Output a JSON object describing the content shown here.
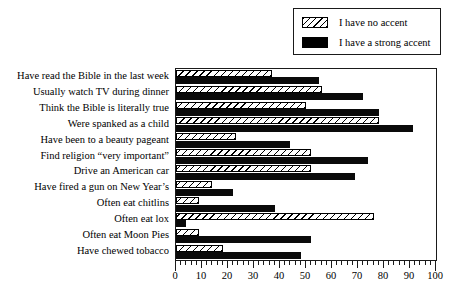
{
  "chart_data": {
    "type": "bar",
    "orientation": "horizontal",
    "title": "",
    "subtitle": "",
    "xlabel": "",
    "ylabel": "",
    "xlim": [
      0,
      100
    ],
    "xticks": [
      0,
      10,
      20,
      30,
      40,
      50,
      60,
      70,
      80,
      90,
      100
    ],
    "xtick_labels": [
      "0",
      "10",
      "20",
      "30",
      "40",
      "50",
      "60",
      "70",
      "80",
      "90",
      "100"
    ],
    "minor_tick_step": 2,
    "grid": false,
    "legend_position": "top-right",
    "categories": [
      "Have read the Bible in the last week",
      "Usually watch TV during dinner",
      "Think the Bible is literally true",
      "Were spanked as a child",
      "Have been to a beauty pageant",
      "Find religion “very important”",
      "Drive an American car",
      "Have fired a gun on New Year’s",
      "Often eat chitlins",
      "Often eat lox",
      "Often eat Moon Pies",
      "Have chewed tobacco"
    ],
    "series": [
      {
        "name": "I have no accent",
        "fill": "hatched",
        "color": "#ffffff",
        "edge_color": "#000000",
        "values": [
          37,
          56,
          50,
          78,
          23,
          52,
          52,
          14,
          9,
          76,
          9,
          18
        ]
      },
      {
        "name": "I have a strong accent",
        "fill": "solid",
        "color": "#000000",
        "edge_color": "#000000",
        "values": [
          55,
          72,
          78,
          91,
          44,
          74,
          69,
          22,
          38,
          4,
          52,
          48
        ]
      }
    ]
  },
  "legend": {
    "items": [
      {
        "label": "I have no accent",
        "swatch": "hatched"
      },
      {
        "label": "I have a strong accent",
        "swatch": "solid"
      }
    ]
  }
}
